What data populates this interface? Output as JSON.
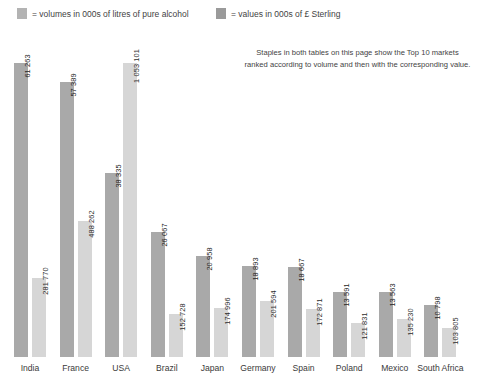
{
  "legend": {
    "volumes": {
      "label": "= volumes in 000s of litres of pure alcohol",
      "color": "#b3b3b3",
      "icon": "legend-swatch-volumes"
    },
    "values": {
      "label": "= values in 000s of £ Sterling",
      "color": "#9a9a9a",
      "icon": "legend-swatch-values"
    }
  },
  "note": {
    "line1": "Staples in both tables on this page show the Top 10 markets",
    "line2": "ranked according to volume and then with the corresponding value."
  },
  "chart_data": {
    "type": "bar",
    "title": "",
    "xlabel": "",
    "ylabel": "",
    "grid": false,
    "legend_position": "top",
    "categories": [
      "India",
      "France",
      "USA",
      "Brazil",
      "Japan",
      "Germany",
      "Spain",
      "Poland",
      "Mexico",
      "South Africa"
    ],
    "series": [
      {
        "name": "volumes in 000s of litres of pure alcohol",
        "color": "#a9a9a9",
        "values": [
          61263,
          57389,
          38335,
          26067,
          20958,
          18893,
          18667,
          13591,
          13563,
          10798
        ],
        "labels": [
          "61 263",
          "57 389",
          "38 335",
          "26 067",
          "20 958",
          "18 893",
          "18 667",
          "13 591",
          "13 563",
          "10 798"
        ]
      },
      {
        "name": "values in 000s of £ Sterling",
        "color": "#d6d6d6",
        "values": [
          281770,
          488262,
          1053101,
          152728,
          174996,
          201594,
          172871,
          121831,
          135230,
          103805
        ],
        "labels": [
          "281 770",
          "488 262",
          "1 053 101",
          "152 728",
          "174 996",
          "201 594",
          "172 871",
          "121 831",
          "135 230",
          "103 805"
        ]
      }
    ],
    "volume_axis_max": 67500,
    "value_axis_max": 1160000
  }
}
